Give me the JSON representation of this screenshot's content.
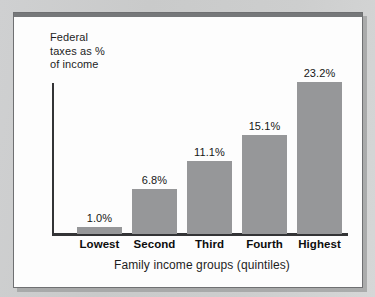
{
  "chart_data": {
    "type": "bar",
    "title": "",
    "subtitle": "",
    "xlabel": "Family income groups (quintiles)",
    "ylabel": "Federal\ntaxes as %\nof income",
    "categories": [
      "Lowest",
      "Second",
      "Third",
      "Fourth",
      "Highest"
    ],
    "values": [
      1.0,
      6.8,
      11.1,
      15.1,
      23.2
    ],
    "value_labels": [
      "1.0%",
      "6.8%",
      "11.1%",
      "15.1%",
      "23.2%"
    ],
    "ylim": [
      0,
      23.2
    ],
    "grid": false,
    "legend": false,
    "legend_position": "none",
    "bar_color": "#969799",
    "axis_color": "#333436",
    "text_color": "#1d1d1d",
    "panel_color": "#fdfdfd",
    "background_color": "#c9cacb"
  }
}
